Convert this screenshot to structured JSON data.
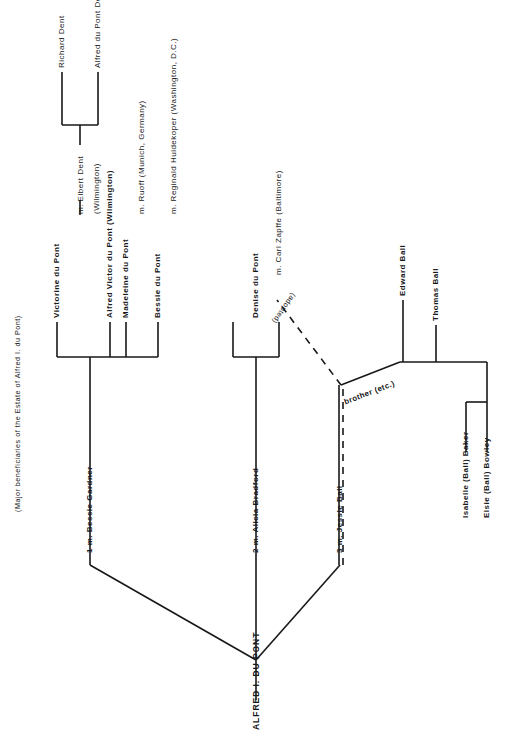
{
  "title": "(Major beneficiaries of the Estate of Alfred I. du Pont)",
  "root": {
    "label": "ALFRED I. DU PONT"
  },
  "marriages": [
    {
      "id": "m1",
      "label": "1 m. Bessie Gardner"
    },
    {
      "id": "m2",
      "label": "2 m. Alicia Bradford"
    },
    {
      "id": "m3",
      "label": "3 m. Jessie Ball"
    }
  ],
  "children_m1": [
    {
      "label": "Victorine du Pont"
    },
    {
      "label": "Alfred Victor du Pont (Wilmington)"
    },
    {
      "label": "Madeleine du Pont"
    },
    {
      "label": "Bessie du Pont"
    }
  ],
  "spouses_m1": [
    {
      "label": "m. Elbert Dent"
    },
    {
      "label": "(Wilmington)"
    },
    {
      "label": "m. Ruoff (Munich, Germany)"
    },
    {
      "label": "m. Reginald Huidekoper (Washington, D.C.)"
    }
  ],
  "dent_children": [
    {
      "label": "Richard Dent"
    },
    {
      "label": "Alfred du Pont Dent"
    }
  ],
  "children_m2": [
    {
      "label": "Denise du Pont"
    }
  ],
  "spouses_m2": [
    {
      "label": "m. Carl Zapffe (Baltimore)"
    }
  ],
  "edge_labels": {
    "adopted": "(adopted)",
    "brother": "brother (etc.)"
  },
  "ball_family": [
    {
      "label": "Edward Ball"
    },
    {
      "label": "Thomas Ball"
    },
    {
      "label": "Isabelle (Ball) Baker"
    },
    {
      "label": "Elsie (Ball) Bowley"
    }
  ],
  "colors": {
    "ink": "#17181a",
    "paper": "#ffffff"
  }
}
